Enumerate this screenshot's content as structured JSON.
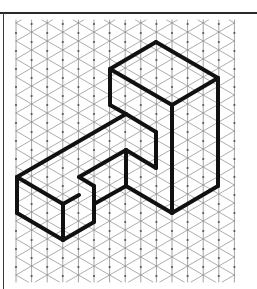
{
  "diagram": {
    "type": "isometric-drawing",
    "colors": {
      "background": "#ffffff",
      "grid_line": "#8a8a8a",
      "grid_node": "#555555",
      "outline": "#111111",
      "frame": "#2a2a2a"
    },
    "grid": {
      "origin_x": 16,
      "column_spacing": 15.6,
      "columns": 15,
      "even_column_first_node_y": 33,
      "odd_column_first_node_y": 24,
      "row_spacing": 18,
      "top_y": 20,
      "bottom_y": 282
    },
    "shape_edges": [
      [
        [
          156,
          42
        ],
        [
          110,
          69
        ]
      ],
      [
        [
          156,
          42
        ],
        [
          218,
          78
        ]
      ],
      [
        [
          218,
          78
        ],
        [
          172,
          105
        ]
      ],
      [
        [
          110,
          69
        ],
        [
          172,
          105
        ]
      ],
      [
        [
          110,
          69
        ],
        [
          110,
          105
        ]
      ],
      [
        [
          218,
          78
        ],
        [
          218,
          186
        ]
      ],
      [
        [
          172,
          105
        ],
        [
          172,
          213
        ]
      ],
      [
        [
          218,
          186
        ],
        [
          172,
          213
        ]
      ],
      [
        [
          110,
          105
        ],
        [
          126,
          114
        ]
      ],
      [
        [
          126,
          114
        ],
        [
          156,
          132
        ]
      ],
      [
        [
          156,
          132
        ],
        [
          156,
          168
        ]
      ],
      [
        [
          126,
          114
        ],
        [
          17,
          177
        ]
      ],
      [
        [
          17,
          177
        ],
        [
          63,
          204
        ]
      ],
      [
        [
          17,
          177
        ],
        [
          17,
          213
        ]
      ],
      [
        [
          17,
          213
        ],
        [
          63,
          240
        ]
      ],
      [
        [
          63,
          204
        ],
        [
          63,
          240
        ]
      ],
      [
        [
          63,
          204
        ],
        [
          79,
          195
        ]
      ],
      [
        [
          63,
          240
        ],
        [
          94,
          222
        ]
      ],
      [
        [
          79,
          177
        ],
        [
          126,
          150
        ]
      ],
      [
        [
          79,
          177
        ],
        [
          94,
          186
        ]
      ],
      [
        [
          94,
          186
        ],
        [
          94,
          222
        ]
      ],
      [
        [
          126,
          150
        ],
        [
          156,
          168
        ]
      ],
      [
        [
          126,
          150
        ],
        [
          126,
          186
        ]
      ],
      [
        [
          94,
          204
        ],
        [
          126,
          186
        ]
      ],
      [
        [
          126,
          186
        ],
        [
          172,
          213
        ]
      ]
    ]
  }
}
